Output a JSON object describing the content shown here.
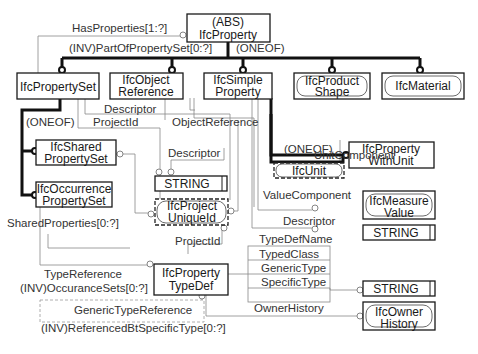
{
  "entities": {
    "ifc_property": {
      "line1": "(ABS)",
      "line2": "IfcProperty"
    },
    "ifc_property_set": {
      "line1": "IfcPropertySet"
    },
    "ifc_object_reference": {
      "line1": "IfcObject",
      "line2": "Reference"
    },
    "ifc_simple_property": {
      "line1": "IfcSimple",
      "line2": "Property"
    },
    "ifc_product_shape": {
      "line1": "IfcProduct",
      "line2": "Shape"
    },
    "ifc_material": {
      "line1": "IfcMaterial"
    },
    "ifc_shared_property_set": {
      "line1": "IfcShared",
      "line2": "PropertySet"
    },
    "ifc_occurrence_property_set": {
      "line1": "IfcOccurrence",
      "line2": "PropertySet"
    },
    "ifc_property_with_unit": {
      "line1": "IfcProperty",
      "line2": "WithUnit"
    },
    "ifc_unit": {
      "line1": "IfcUnit"
    },
    "string_1": {
      "line1": "STRING"
    },
    "ifc_project_unique_id": {
      "line1": "IfcProject",
      "line2": "UniqueId"
    },
    "ifc_measure_value": {
      "line1": "IfcMeasure",
      "line2": "Value"
    },
    "string_2": {
      "line1": "STRING"
    },
    "ifc_property_type_def": {
      "line1": "IfcProperty",
      "line2": "TypeDef"
    },
    "string_3": {
      "line1": "STRING"
    },
    "ifc_owner_history": {
      "line1": "IfcOwner",
      "line2": "History"
    }
  },
  "relations": {
    "has_properties": "HasProperties[1:?]",
    "part_of_property_set": "(INV)PartOfPropertySet[0:?]",
    "oneof_top": "(ONEOF)",
    "descriptor_objref": "Descriptor",
    "project_id_set": "ProjectId",
    "object_reference": "ObjectReference",
    "oneof_set": "(ONEOF)",
    "oneof_simple": "(ONEOF)",
    "descriptor_string": "Descriptor",
    "unit_component": "UnitComponent",
    "value_component": "ValueComponent",
    "descriptor_simple": "Descriptor",
    "shared_properties": "SharedProperties[0:?]",
    "project_id_typedef": "ProjectId",
    "type_def_name": "TypeDefName",
    "typed_class": "TypedClass",
    "generic_type": "GenericType",
    "specific_type": "SpecificType",
    "type_reference": "TypeReference",
    "occurance_sets": "(INV)OccuranceSets[0:?]",
    "generic_type_reference": "GenericTypeReference",
    "owner_history": "OwnerHistory",
    "referenced_by_specific_type": "(INV)ReferencedBtSpecificType[0:?]"
  }
}
